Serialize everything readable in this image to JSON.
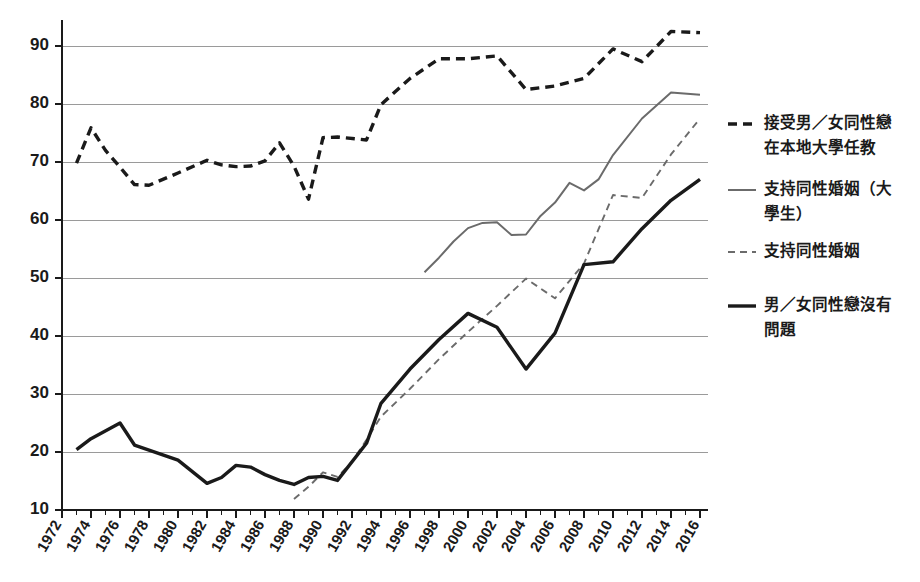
{
  "chart_data": {
    "type": "line",
    "title": "",
    "subtitle": "",
    "xlabel": "",
    "ylabel": "",
    "xlim": [
      1972,
      2016
    ],
    "ylim": [
      10,
      95
    ],
    "yticks": [
      10,
      20,
      30,
      40,
      50,
      60,
      70,
      80,
      90
    ],
    "ytick_labels": [
      "10",
      "20",
      "30",
      "40",
      "50",
      "60",
      "70",
      "80",
      "90"
    ],
    "xticks": [
      1972,
      1974,
      1976,
      1978,
      1980,
      1982,
      1984,
      1986,
      1988,
      1990,
      1992,
      1994,
      1996,
      1998,
      2000,
      2002,
      2004,
      2006,
      2008,
      2010,
      2012,
      2014,
      2016
    ],
    "xtick_labels": [
      "1972",
      "1974",
      "1976",
      "1978",
      "1980",
      "1982",
      "1984",
      "1986",
      "1988",
      "1990",
      "1992",
      "1994",
      "1996",
      "1998",
      "2000",
      "2002",
      "2004",
      "2006",
      "2008",
      "2010",
      "2012",
      "2014",
      "2016"
    ],
    "grid": true,
    "grid_axis": "y",
    "legend_position": "right",
    "series": [
      {
        "name": "接受男／女同性戀在本地大學任教",
        "style": "dashed",
        "color": "#1a1a1a",
        "width": 3.4,
        "dash": "9,6",
        "points": [
          [
            1973,
            69.8
          ],
          [
            1974,
            75.9
          ],
          [
            1975,
            72.0
          ],
          [
            1976,
            69.1
          ],
          [
            1977,
            66.1
          ],
          [
            1978,
            66.0
          ],
          [
            1980,
            68.1
          ],
          [
            1982,
            70.3
          ],
          [
            1983,
            69.5
          ],
          [
            1984,
            69.2
          ],
          [
            1985,
            69.3
          ],
          [
            1986,
            70.2
          ],
          [
            1987,
            73.3
          ],
          [
            1988,
            69.3
          ],
          [
            1989,
            63.6
          ],
          [
            1990,
            74.2
          ],
          [
            1991,
            74.3
          ],
          [
            1993,
            73.8
          ],
          [
            1994,
            79.9
          ],
          [
            1996,
            84.4
          ],
          [
            1998,
            87.8
          ],
          [
            2000,
            87.8
          ],
          [
            2002,
            88.3
          ],
          [
            2004,
            82.5
          ],
          [
            2006,
            83.1
          ],
          [
            2008,
            84.4
          ],
          [
            2010,
            89.5
          ],
          [
            2012,
            87.3
          ],
          [
            2014,
            92.5
          ],
          [
            2016,
            92.3
          ]
        ]
      },
      {
        "name": "支持同性婚姻（大學生）",
        "style": "solid",
        "color": "#6b6b6b",
        "width": 2.0,
        "dash": "none",
        "points": [
          [
            1997,
            51.0
          ],
          [
            1998,
            53.5
          ],
          [
            1999,
            56.3
          ],
          [
            2000,
            58.6
          ],
          [
            2001,
            59.5
          ],
          [
            2002,
            59.6
          ],
          [
            2003,
            57.4
          ],
          [
            2004,
            57.5
          ],
          [
            2005,
            60.7
          ],
          [
            2006,
            63.0
          ],
          [
            2007,
            66.4
          ],
          [
            2008,
            65.1
          ],
          [
            2009,
            67.0
          ],
          [
            2010,
            71.2
          ],
          [
            2012,
            77.5
          ],
          [
            2014,
            82.0
          ],
          [
            2016,
            81.6
          ]
        ]
      },
      {
        "name": "支持同性婚姻",
        "style": "dashed",
        "color": "#6b6b6b",
        "width": 1.9,
        "dash": "7,5",
        "points": [
          [
            1988,
            11.9
          ],
          [
            1989,
            14.0
          ],
          [
            1990,
            16.5
          ],
          [
            1991,
            15.7
          ],
          [
            1992,
            18.3
          ],
          [
            1993,
            22.1
          ],
          [
            1994,
            26.1
          ],
          [
            1996,
            30.9
          ],
          [
            1998,
            36.0
          ],
          [
            2000,
            40.7
          ],
          [
            2002,
            45.2
          ],
          [
            2004,
            49.9
          ],
          [
            2006,
            46.5
          ],
          [
            2008,
            52.5
          ],
          [
            2010,
            64.3
          ],
          [
            2012,
            63.8
          ],
          [
            2014,
            71.3
          ],
          [
            2016,
            77.5
          ]
        ]
      },
      {
        "name": "男／女同性戀沒有問題",
        "style": "solid",
        "color": "#1a1a1a",
        "width": 3.4,
        "dash": "none",
        "points": [
          [
            1973,
            20.4
          ],
          [
            1974,
            22.3
          ],
          [
            1976,
            25.0
          ],
          [
            1977,
            21.2
          ],
          [
            1980,
            18.6
          ],
          [
            1982,
            14.6
          ],
          [
            1983,
            15.6
          ],
          [
            1984,
            17.7
          ],
          [
            1985,
            17.4
          ],
          [
            1986,
            16.1
          ],
          [
            1987,
            15.1
          ],
          [
            1988,
            14.4
          ],
          [
            1989,
            15.6
          ],
          [
            1990,
            15.8
          ],
          [
            1991,
            15.1
          ],
          [
            1993,
            21.5
          ],
          [
            1994,
            28.4
          ],
          [
            1996,
            34.3
          ],
          [
            1998,
            39.4
          ],
          [
            2000,
            43.9
          ],
          [
            2002,
            41.5
          ],
          [
            2004,
            34.3
          ],
          [
            2006,
            40.5
          ],
          [
            2008,
            52.3
          ],
          [
            2010,
            52.8
          ],
          [
            2012,
            58.5
          ],
          [
            2014,
            63.4
          ],
          [
            2016,
            67.0
          ]
        ]
      }
    ]
  },
  "legend": {
    "items": [
      {
        "label_lines": [
          "接受男／女同性戀",
          "在本地大學任教"
        ],
        "series_index": 0
      },
      {
        "label_lines": [
          "支持同性婚姻（大",
          "學生）"
        ],
        "series_index": 1
      },
      {
        "label_lines": [
          "支持同性婚姻"
        ],
        "series_index": 2
      },
      {
        "label_lines": [
          "男／女同性戀沒有",
          "問題"
        ],
        "series_index": 3
      }
    ]
  }
}
